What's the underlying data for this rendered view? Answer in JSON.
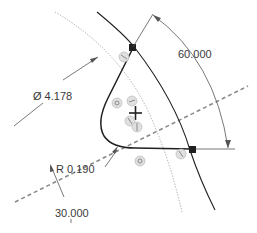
{
  "sketch": {
    "dimensions": {
      "diameter": {
        "symbol": "Ø",
        "value": "4.178",
        "label": "Ø 4.178"
      },
      "angle_top": {
        "value": "60.000",
        "label": "60.000"
      },
      "radius": {
        "symbol": "R",
        "value": "0.190",
        "label": "R 0.190"
      },
      "angle_bottom": {
        "value": "30.000",
        "label": "30.000"
      }
    },
    "entities": {
      "centerline": "dashed-centerline",
      "construction_arc": "dotted-construction-arc",
      "outer_arc": "solid-arc",
      "profile": "closed-profile"
    },
    "constraints": [
      {
        "icon": "coincident-icon"
      },
      {
        "icon": "tangent-icon"
      },
      {
        "icon": "tangent-icon"
      },
      {
        "icon": "coincident-icon"
      },
      {
        "icon": "tangent-icon"
      },
      {
        "icon": "tangent-icon"
      },
      {
        "icon": "coincident-icon"
      }
    ],
    "colors": {
      "geometry": "#202020",
      "dimension": "#555555",
      "centerline": "#8a8a8a",
      "text": "#3a3a3a"
    }
  }
}
